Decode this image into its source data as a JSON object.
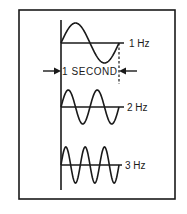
{
  "diagram": {
    "duration_label": "1 SECOND",
    "waves": [
      {
        "label": "1 Hz",
        "cycles": 1
      },
      {
        "label": "2 Hz",
        "cycles": 2
      },
      {
        "label": "3 Hz",
        "cycles": 3
      }
    ],
    "colors": {
      "ink": "#1a1a1a",
      "paper": "#ffffff"
    }
  }
}
